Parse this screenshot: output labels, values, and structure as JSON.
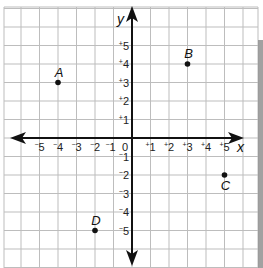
{
  "chart_data": {
    "type": "scatter",
    "title": "",
    "xlabel": "x",
    "ylabel": "y",
    "xlim": [
      -5,
      5
    ],
    "ylim": [
      -5,
      5
    ],
    "grid": true,
    "x_ticks": [
      "-5",
      "-4",
      "-3",
      "-2",
      "-1",
      "0",
      "+1",
      "+2",
      "+3",
      "+4",
      "+5"
    ],
    "y_ticks": [
      "+5",
      "+4",
      "+3",
      "+2",
      "+1",
      "-1",
      "-2",
      "-3",
      "-4",
      "-5"
    ],
    "points": [
      {
        "label": "A",
        "x": -4,
        "y": 3
      },
      {
        "label": "B",
        "x": 3,
        "y": 4
      },
      {
        "label": "C",
        "x": 5,
        "y": -2
      },
      {
        "label": "D",
        "x": -2,
        "y": -5
      }
    ]
  },
  "axes": {
    "x_label": "x",
    "y_label": "y",
    "origin_label": "0"
  },
  "colors": {
    "grid": "#b8b8b8",
    "axis": "#111111",
    "border_strip": "#8a8a8a"
  }
}
